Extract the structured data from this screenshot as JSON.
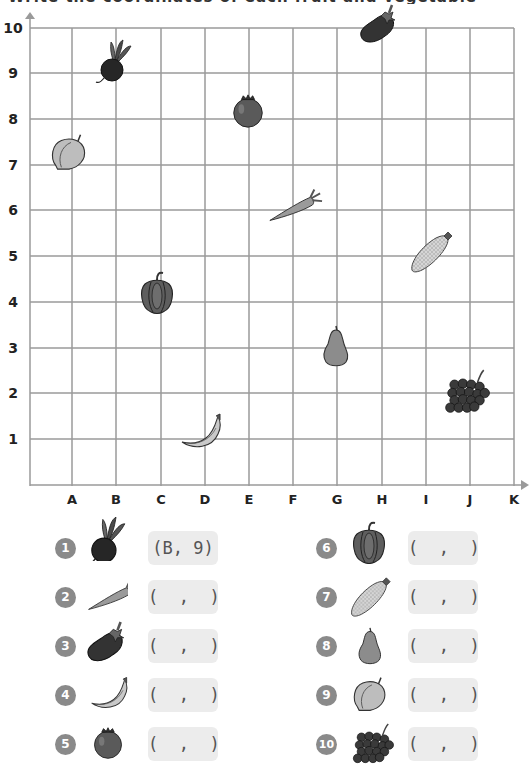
{
  "title": "Write the coordinates of each fruit and vegetable",
  "grid": {
    "x_labels": [
      "A",
      "B",
      "C",
      "D",
      "E",
      "F",
      "G",
      "H",
      "I",
      "J",
      "K"
    ],
    "y_labels": [
      "1",
      "2",
      "3",
      "4",
      "5",
      "6",
      "7",
      "8",
      "9",
      "10"
    ],
    "line_color": "#9a9a9a",
    "axis_color": "#8a8a8a"
  },
  "plotted_items": [
    {
      "name": "beet",
      "col": "B",
      "row": 9
    },
    {
      "name": "carrot",
      "col": "F",
      "row": 6
    },
    {
      "name": "eggplant",
      "col": "H",
      "row": 10
    },
    {
      "name": "banana",
      "col": "D",
      "row": 1
    },
    {
      "name": "pomegranate",
      "col": "E",
      "row": 8
    },
    {
      "name": "bell-pepper",
      "col": "C",
      "row": 4
    },
    {
      "name": "corn",
      "col": "I",
      "row": 5
    },
    {
      "name": "pear",
      "col": "G",
      "row": 3
    },
    {
      "name": "peach",
      "col": "A",
      "row": 7
    },
    {
      "name": "grapes",
      "col": "J",
      "row": 2
    }
  ],
  "questions": [
    {
      "number": "1",
      "item": "beet",
      "answer": "(B, 9)"
    },
    {
      "number": "2",
      "item": "carrot",
      "answer": "(  ,  )"
    },
    {
      "number": "3",
      "item": "eggplant",
      "answer": "(  ,  )"
    },
    {
      "number": "4",
      "item": "banana",
      "answer": "(  ,  )"
    },
    {
      "number": "5",
      "item": "pomegranate",
      "answer": "(  ,  )"
    },
    {
      "number": "6",
      "item": "bell-pepper",
      "answer": "(  ,  )"
    },
    {
      "number": "7",
      "item": "corn",
      "answer": "(  ,  )"
    },
    {
      "number": "8",
      "item": "pear",
      "answer": "(  ,  )"
    },
    {
      "number": "9",
      "item": "peach",
      "answer": "(  ,  )"
    },
    {
      "number": "10",
      "item": "grapes",
      "answer": "(  ,  )"
    }
  ]
}
